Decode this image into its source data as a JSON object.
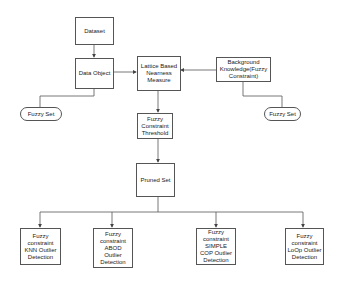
{
  "diagram": {
    "nodes": {
      "dataset": "Dataset",
      "data_object": "Data Object",
      "lattice": "Lattice Based Nearness Measure",
      "background": "Background Knowledge(Fuzzy Constraint)",
      "fuzzy_set_left": "Fuzzy Set",
      "fuzzy_set_right": "Fuzzy Set",
      "threshold": "Fuzzy Constraint Threshold",
      "pruned": "Pruned Set",
      "knn": "Fuzzy constraint KNN Outlier Detection",
      "abod": "Fuzzy constraint ABOD Outlier Detection",
      "simple_cop": "Fuzzy constraint SIMPLE COP Outlier Detection",
      "loop": "Fuzzy constraint LoOp Outlier Detection"
    },
    "edges": [
      {
        "from": "dataset",
        "to": "data_object",
        "arrow": true
      },
      {
        "from": "data_object",
        "to": "lattice",
        "arrow": true
      },
      {
        "from": "background",
        "to": "lattice",
        "arrow": true
      },
      {
        "from": "data_object",
        "to": "fuzzy_set_left",
        "arrow": false
      },
      {
        "from": "background",
        "to": "fuzzy_set_right",
        "arrow": false
      },
      {
        "from": "lattice",
        "to": "threshold",
        "arrow": true
      },
      {
        "from": "threshold",
        "to": "pruned",
        "arrow": true
      },
      {
        "from": "pruned",
        "to": "knn",
        "arrow": true
      },
      {
        "from": "pruned",
        "to": "abod",
        "arrow": true
      },
      {
        "from": "pruned",
        "to": "simple_cop",
        "arrow": true
      },
      {
        "from": "pruned",
        "to": "loop",
        "arrow": true
      }
    ]
  }
}
